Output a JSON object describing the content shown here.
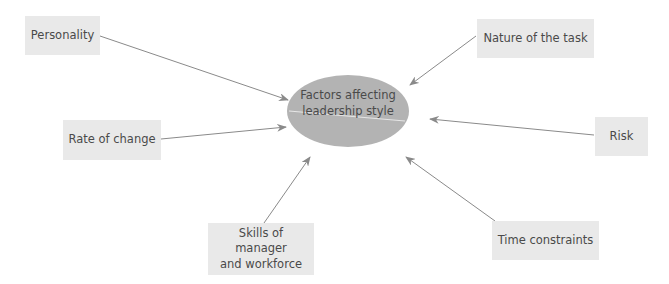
{
  "diagram": {
    "type": "spider-diagram",
    "center": {
      "label_line1": "Factors affecting",
      "label_line2": "leadership style",
      "fill": "#b3b3b3"
    },
    "factors": [
      {
        "id": "personality",
        "label": "Personality"
      },
      {
        "id": "rate-of-change",
        "label": "Rate of change"
      },
      {
        "id": "nature-of-task",
        "label": "Nature of the task"
      },
      {
        "id": "risk",
        "label": "Risk"
      },
      {
        "id": "skills",
        "label_line1": "Skills of manager",
        "label_line2": "and workforce"
      },
      {
        "id": "time-constraints",
        "label": "Time constraints"
      }
    ],
    "colors": {
      "box": "#e9e9e9",
      "arrow": "#8a8a8a",
      "text": "#4a4a4a"
    }
  }
}
